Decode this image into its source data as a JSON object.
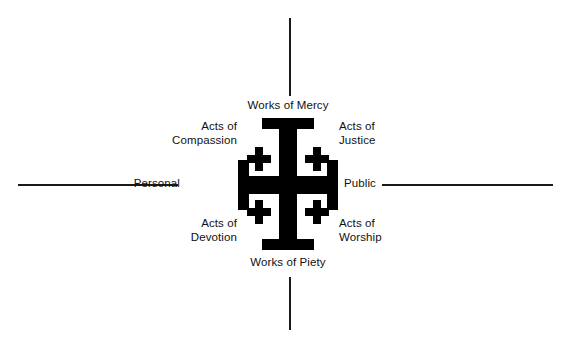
{
  "diagram": {
    "symbol": "jerusalem-cross",
    "colors": {
      "cross": "#000000",
      "axis": "#1a1a1a",
      "text": "#111111",
      "background": "#ffffff"
    },
    "axes": {
      "vertical": {
        "top_label": "Works of Mercy",
        "bottom_label": "Works of Piety"
      },
      "horizontal": {
        "left_label": "Personal",
        "right_label": "Public"
      }
    },
    "quadrants": [
      {
        "position": "top-left",
        "label": "Acts of\nCompassion"
      },
      {
        "position": "top-right",
        "label": "Acts of\nJustice"
      },
      {
        "position": "bottom-left",
        "label": "Acts of\nDevotion"
      },
      {
        "position": "bottom-right",
        "label": "Acts of\nWorship"
      }
    ],
    "labels": {
      "works_of_mercy": "Works of Mercy",
      "works_of_piety": "Works of Piety",
      "personal": "Personal",
      "public": "Public",
      "acts_of_compassion": "Acts of\nCompassion",
      "acts_of_justice": "Acts of\nJustice",
      "acts_of_devotion": "Acts of\nDevotion",
      "acts_of_worship": "Acts of\nWorship"
    }
  }
}
